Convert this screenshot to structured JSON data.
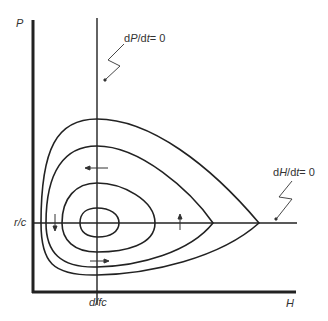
{
  "diagram": {
    "type": "phase-plane",
    "axes": {
      "y_label": "P",
      "x_label": "H",
      "y_tick_label": "r/c",
      "x_tick_label": "d/fc"
    },
    "nullclines": {
      "vertical": {
        "label_prefix": "d",
        "label_var": "P",
        "label_mid": "/d",
        "label_t": "t",
        "label_suffix": "= 0"
      },
      "horizontal": {
        "label_prefix": "d",
        "label_var": "H",
        "label_mid": "/d",
        "label_t": "t",
        "label_suffix": "= 0"
      }
    },
    "orbits": 4,
    "direction_arrows": [
      "left",
      "down",
      "right",
      "up"
    ],
    "colors": {
      "line": "#222222",
      "background": "#ffffff"
    }
  }
}
